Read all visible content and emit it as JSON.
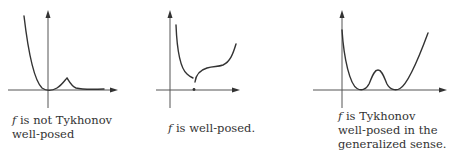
{
  "figure": {
    "panels": [
      {
        "id": "not-well-posed",
        "caption": {
          "var": "f",
          "line1_rest": " is not Tykhonov",
          "line2": "well-posed",
          "line3": ""
        },
        "curve_description": "Steep descent to a minimum at the origin, a small bump, then the curve approaches the x-axis asymptotically"
      },
      {
        "id": "well-posed",
        "caption": {
          "var": "f",
          "line1_rest": " is well-posed.",
          "line2": "",
          "line3": ""
        },
        "curve_description": "Discontinuous function: decreasing branch, jump with isolated point on the x-axis, then increasing branch"
      },
      {
        "id": "generalized-well-posed",
        "caption": {
          "var": "f",
          "line1_rest": " is Tykhonov",
          "line2": "well-posed in the",
          "line3": "generalized sense."
        },
        "curve_description": "W-shaped curve with two minima touching the x-axis separated by a bump"
      }
    ],
    "colors": {
      "curve": "#333333",
      "axis": "#555555",
      "text": "#333333",
      "background": "#ffffff"
    }
  }
}
